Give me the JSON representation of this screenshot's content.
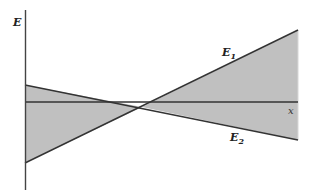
{
  "figure": {
    "y_axis_label": "E",
    "x_axis_label": "x",
    "line1": {
      "label_main": "E",
      "label_sub": "1"
    },
    "line2": {
      "label_main": "E",
      "label_sub": "2"
    }
  },
  "colors": {
    "fill": "#c0c0c0",
    "line": "#333333",
    "axis": "#444444",
    "background": "#ffffff"
  }
}
